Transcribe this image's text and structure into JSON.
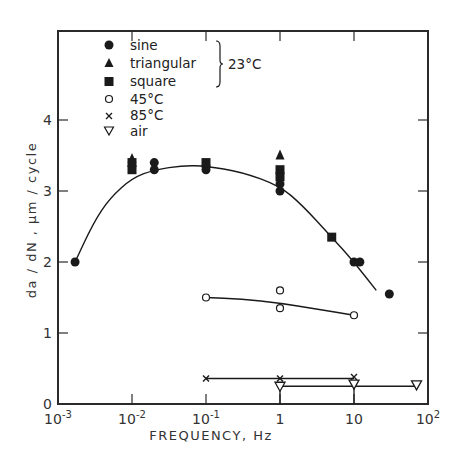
{
  "chart_data": {
    "type": "scatter",
    "title": "",
    "xlabel": "FREQUENCY, Hz",
    "ylabel": "da/dN, µm/cycle",
    "xscale": "log",
    "xlim": [
      0.001,
      100
    ],
    "ylim": [
      0,
      5.2
    ],
    "x_ticks": [
      {
        "value": 0.001,
        "label": "10",
        "exp": "-3"
      },
      {
        "value": 0.01,
        "label": "10",
        "exp": "-2"
      },
      {
        "value": 0.1,
        "label": "10",
        "exp": "-1"
      },
      {
        "value": 1,
        "label": "1",
        "exp": ""
      },
      {
        "value": 10,
        "label": "10",
        "exp": ""
      },
      {
        "value": 100,
        "label": "10",
        "exp": "2"
      }
    ],
    "y_ticks": [
      0,
      1,
      2,
      3,
      4
    ],
    "grid": false,
    "legend_position": "upper-left inside",
    "legend_group_label": "23°C",
    "series": [
      {
        "name": "sine",
        "marker": "filled-circle",
        "group": "23°C",
        "points": [
          [
            0.0017,
            2.0
          ],
          [
            0.02,
            3.4
          ],
          [
            0.02,
            3.3
          ],
          [
            0.1,
            3.3
          ],
          [
            0.1,
            3.35
          ],
          [
            1,
            3.0
          ],
          [
            1,
            3.1
          ],
          [
            10,
            2.0
          ],
          [
            12,
            2.0
          ],
          [
            30,
            1.55
          ]
        ]
      },
      {
        "name": "triangular",
        "marker": "filled-triangle",
        "group": "23°C",
        "points": [
          [
            0.01,
            3.45
          ],
          [
            1,
            3.5
          ]
        ]
      },
      {
        "name": "square",
        "marker": "filled-square",
        "group": "23°C",
        "points": [
          [
            0.01,
            3.3
          ],
          [
            0.01,
            3.4
          ],
          [
            0.1,
            3.4
          ],
          [
            1,
            3.3
          ],
          [
            1,
            3.2
          ],
          [
            5,
            2.35
          ]
        ]
      },
      {
        "name": "45°C",
        "marker": "open-circle",
        "points": [
          [
            0.1,
            1.5
          ],
          [
            1,
            1.6
          ],
          [
            1,
            1.35
          ],
          [
            10,
            1.25
          ]
        ]
      },
      {
        "name": "85°C",
        "marker": "x",
        "points": [
          [
            0.1,
            0.36
          ],
          [
            1,
            0.36
          ],
          [
            10,
            0.38
          ]
        ]
      },
      {
        "name": "air",
        "marker": "open-down-triangle",
        "points": [
          [
            1,
            0.25
          ],
          [
            10,
            0.28
          ],
          [
            70,
            0.27
          ]
        ]
      }
    ],
    "fit_curves": [
      {
        "for": "23°C",
        "points": [
          [
            0.0017,
            2.0
          ],
          [
            0.003,
            2.55
          ],
          [
            0.005,
            2.9
          ],
          [
            0.01,
            3.18
          ],
          [
            0.02,
            3.3
          ],
          [
            0.05,
            3.36
          ],
          [
            0.1,
            3.35
          ],
          [
            0.3,
            3.27
          ],
          [
            1,
            3.07
          ],
          [
            2,
            2.8
          ],
          [
            5,
            2.35
          ],
          [
            10,
            2.0
          ],
          [
            20,
            1.6
          ]
        ]
      },
      {
        "for": "45°C",
        "points": [
          [
            0.1,
            1.5
          ],
          [
            0.3,
            1.48
          ],
          [
            1,
            1.42
          ],
          [
            3,
            1.34
          ],
          [
            10,
            1.25
          ]
        ]
      },
      {
        "for": "85°C",
        "points": [
          [
            0.1,
            0.36
          ],
          [
            10,
            0.36
          ]
        ]
      },
      {
        "for": "air",
        "points": [
          [
            1,
            0.25
          ],
          [
            70,
            0.25
          ]
        ]
      }
    ]
  },
  "legend": {
    "items": [
      {
        "label": "sine"
      },
      {
        "label": "triangular"
      },
      {
        "label": "square"
      },
      {
        "label": "45°C"
      },
      {
        "label": "85°C"
      },
      {
        "label": "air"
      }
    ],
    "group_label": "23°C"
  },
  "axes": {
    "xlabel": "FREQUENCY,  Hz",
    "ylabel": "da / dN ,  µm / cycle",
    "y_tick_labels": [
      "0",
      "1",
      "2",
      "3",
      "4"
    ]
  },
  "colors": {
    "ink": "#1a1a1a",
    "frame": "#2a2a2a",
    "background": "#ffffff"
  }
}
